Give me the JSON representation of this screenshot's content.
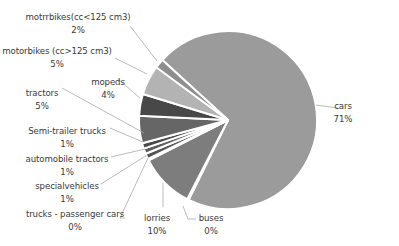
{
  "chart_data": {
    "type": "pie",
    "title": "",
    "center": [
      228,
      120
    ],
    "radius": 89,
    "start_angle_deg": -137.6,
    "slice_gap_color": "#ffffff",
    "slices": [
      {
        "name": "cars",
        "label": "cars",
        "pct_label": "71%",
        "value": 71,
        "color": "#9b9b9b",
        "label_pos": [
          343,
          100
        ],
        "leader": [
          [
            316,
            105
          ],
          [
            338,
            108
          ]
        ]
      },
      {
        "name": "buses",
        "label": "buses",
        "pct_label": "0%",
        "value": 0.3,
        "color": "#9a9a9a",
        "label_pos": [
          211,
          212
        ],
        "leader": [
          [
            183,
            206
          ],
          [
            188,
            219
          ],
          [
            196,
            219
          ]
        ]
      },
      {
        "name": "lorries",
        "label": "lorries",
        "pct_label": "10%",
        "value": 10,
        "color": "#7d7d7d",
        "label_pos": [
          157,
          212
        ],
        "leader": [
          [
            163,
            183
          ],
          [
            163,
            207
          ]
        ]
      },
      {
        "name": "trucks-passenger-cars",
        "label": "trucks - passenger cars",
        "pct_label": "0%",
        "value": 0.3,
        "color": "#6a6a6a",
        "label_pos": [
          75,
          208
        ],
        "leader": [
          [
            148,
            158
          ],
          [
            120,
            218
          ],
          [
            125,
            218
          ]
        ]
      },
      {
        "name": "special-vehicles",
        "label": "specialvehicles",
        "pct_label": "1%",
        "value": 1,
        "color": "#555555",
        "label_pos": [
          67,
          180
        ],
        "leader": [
          [
            147,
            155
          ],
          [
            101,
            184
          ]
        ]
      },
      {
        "name": "automobile-tractors",
        "label": "automobile tractors",
        "pct_label": "1%",
        "value": 1,
        "color": "#5e5e5e",
        "label_pos": [
          67,
          153
        ],
        "leader": [
          [
            145,
            149
          ],
          [
            111,
            157
          ]
        ]
      },
      {
        "name": "semi-trailer-trucks",
        "label": "Semi-trailer trucks",
        "pct_label": "1%",
        "value": 1,
        "color": "#4a4a4a",
        "label_pos": [
          67,
          125
        ],
        "leader": [
          [
            143,
            142
          ],
          [
            110,
            128
          ]
        ]
      },
      {
        "name": "tractors",
        "label": "tractors",
        "pct_label": "5%",
        "value": 5,
        "color": "#666666",
        "label_pos": [
          42,
          87
        ],
        "leader": [
          [
            62,
            88
          ],
          [
            144,
            133
          ]
        ]
      },
      {
        "name": "mopeds",
        "label": "mopeds",
        "pct_label": "4%",
        "value": 4,
        "color": "#484848",
        "label_pos": [
          108,
          76
        ],
        "leader": [
          [
            118,
            79
          ],
          [
            140,
            98
          ]
        ]
      },
      {
        "name": "motorbikes-gt-125",
        "label": "motorbikes (cc>125 cm3)",
        "pct_label": "5%",
        "value": 5.4,
        "color": "#b3b3b3",
        "label_pos": [
          57,
          45
        ],
        "leader": [
          [
            115,
            58
          ],
          [
            147,
            74
          ]
        ]
      },
      {
        "name": "motorbikes-lt-125",
        "label": "motrrbikes(cc<125 cm3)",
        "pct_label": "2%",
        "value": 1.7,
        "color": "#8e8e8e",
        "label_pos": [
          78,
          11
        ],
        "leader": [
          [
            130,
            26
          ],
          [
            157,
            61
          ]
        ]
      }
    ]
  }
}
